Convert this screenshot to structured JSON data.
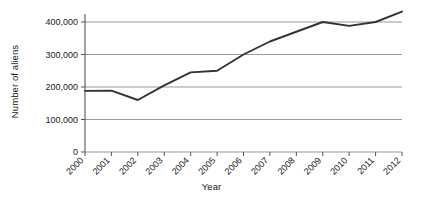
{
  "chart_data": {
    "type": "line",
    "title": "",
    "xlabel": "Year",
    "ylabel": "Number of aliens",
    "categories": [
      "2000",
      "2001",
      "2002",
      "2003",
      "2004",
      "2005",
      "2006",
      "2007",
      "2008",
      "2009",
      "2010",
      "2011",
      "2012"
    ],
    "x": [
      2000,
      2001,
      2002,
      2003,
      2004,
      2005,
      2006,
      2007,
      2008,
      2009,
      2010,
      2011,
      2012
    ],
    "values": [
      188000,
      189000,
      160000,
      205000,
      245000,
      250000,
      300000,
      340000,
      370000,
      400000,
      388000,
      400000,
      432000
    ],
    "series": [
      {
        "name": "Number of aliens",
        "values": [
          188000,
          189000,
          160000,
          205000,
          245000,
          250000,
          300000,
          340000,
          370000,
          400000,
          388000,
          400000,
          432000
        ]
      }
    ],
    "ylim": [
      0,
      440000
    ],
    "xlim": [
      2000,
      2012
    ],
    "yticks": [
      0,
      100000,
      200000,
      300000,
      400000
    ],
    "ytick_labels": [
      "0",
      "100,000",
      "200,000",
      "300,000",
      "400,000"
    ],
    "grid": "horizontal",
    "legend": "none",
    "line_color": "#333333",
    "grid_color": "#9a9a9a",
    "axis_color": "#555555",
    "background_color": "#ffffff"
  }
}
